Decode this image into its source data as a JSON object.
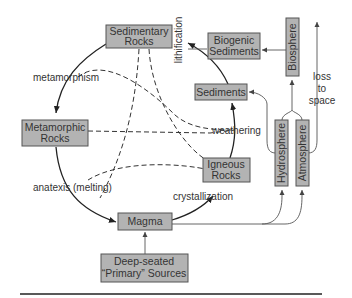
{
  "diagram": {
    "type": "rock-cycle",
    "colors": {
      "box_fill": "#b3b3b3",
      "box_stroke": "#555555",
      "line": "#222222",
      "text": "#333333"
    },
    "nodes": {
      "sedimentary": {
        "line1": "Sedimentary",
        "line2": "Rocks"
      },
      "metamorphic": {
        "line1": "Metamorphic",
        "line2": "Rocks"
      },
      "igneous": {
        "line1": "Igneous",
        "line2": "Rocks"
      },
      "magma": {
        "label": "Magma"
      },
      "sediments": {
        "label": "Sediments"
      },
      "biogenic": {
        "line1": "Biogenic",
        "line2": "Sediments"
      },
      "biosphere": {
        "label": "Biosphere"
      },
      "hydrosphere": {
        "label": "Hydrosphere"
      },
      "atmosphere": {
        "label": "Atmosphere"
      },
      "deep_sources": {
        "line1": "Deep-seated",
        "line2": "“Primary” Sources"
      }
    },
    "edges": {
      "metamorphism": "metamorphism",
      "lithification": "lithification",
      "weathering": "weathering",
      "anatexis": "anatexis (melting)",
      "crystallization": "crystallization",
      "loss_to_space": {
        "line1": "loss",
        "line2": "to",
        "line3": "space"
      }
    }
  }
}
